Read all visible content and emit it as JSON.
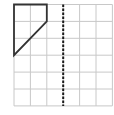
{
  "diagram": {
    "type": "grid-symmetry-exercise",
    "grid": {
      "columns": 6,
      "rows": 6,
      "origin_px": [
        14,
        4.5
      ],
      "cell_width_px": 16.4,
      "cell_height_px": 16.9,
      "line_color": "#c8c8c8"
    },
    "mirror_line": {
      "orientation": "vertical",
      "at_column": 3,
      "style": "dashed",
      "color": "#1a1a1a"
    },
    "shape": {
      "vertices_grid": [
        [
          0,
          0
        ],
        [
          2,
          0
        ],
        [
          2,
          1
        ],
        [
          0,
          3
        ]
      ],
      "stroke_color": "#333333",
      "stroke_width": 1.8,
      "fill": "none"
    }
  }
}
